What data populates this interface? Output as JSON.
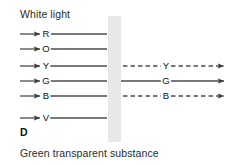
{
  "figure": {
    "title": "White light",
    "panel_label": "D",
    "caption": "Green transparent substance",
    "barrier": {
      "name": "green transparent substance slab",
      "color": "#e8e8e8",
      "x": 108,
      "width": 13,
      "y": 16,
      "height": 126
    },
    "axis": {
      "left_start": 20,
      "arrowhead_left": 40,
      "letter_x_left": 46,
      "blocked_end": 107,
      "right_end": 224,
      "letter_x_right": 166
    },
    "rays": [
      {
        "label": "R",
        "name": "red",
        "y": 34,
        "incident": "solid",
        "transmitted": false,
        "transmitted_style": "none",
        "color": "#4d4d4d"
      },
      {
        "label": "O",
        "name": "orange",
        "y": 49,
        "incident": "solid",
        "transmitted": false,
        "transmitted_style": "none",
        "color": "#4d4d4d"
      },
      {
        "label": "Y",
        "name": "yellow",
        "y": 66,
        "incident": "solid",
        "transmitted": true,
        "transmitted_style": "dashed",
        "color": "#4d4d4d"
      },
      {
        "label": "G",
        "name": "green",
        "y": 81,
        "incident": "solid",
        "transmitted": true,
        "transmitted_style": "solid",
        "color": "#4d4d4d"
      },
      {
        "label": "B",
        "name": "blue",
        "y": 96,
        "incident": "solid",
        "transmitted": true,
        "transmitted_style": "dashed",
        "color": "#4d4d4d"
      },
      {
        "label": "V",
        "name": "violet",
        "y": 118,
        "incident": "solid",
        "transmitted": false,
        "transmitted_style": "none",
        "color": "#4d4d4d"
      }
    ]
  }
}
